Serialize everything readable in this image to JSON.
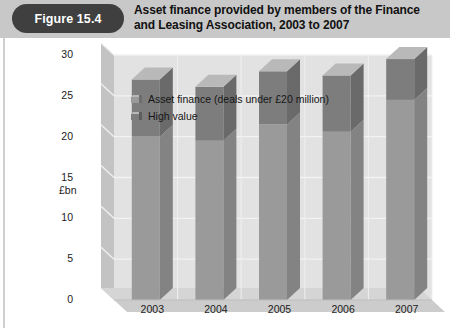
{
  "figure": {
    "number_label": "Figure 15.4",
    "title": "Asset finance provided by members of the Finance and Leasing Association, 2003 to 2007"
  },
  "colors": {
    "header_band": "#c8c8c8",
    "pill": "#3f3f3f",
    "plot_background": "#e2e2e2",
    "wall": "#c3c3c3",
    "floor": "#d5d5d5",
    "asset_finance_front": "#9a9a9a",
    "asset_finance_side": "#838383",
    "high_value_front": "#7d7d7d",
    "high_value_side": "#6a6a6a",
    "bar_top": "#b9b9b9",
    "gridline": "#f2f2f2",
    "text": "#161616"
  },
  "chart_data": {
    "type": "bar",
    "subtype": "stacked-3d-column",
    "title": "Asset finance provided by members of the Finance and Leasing Association, 2003 to 2007",
    "xlabel": "",
    "ylabel": "£bn",
    "ylim": [
      0,
      30
    ],
    "ytick_step": 5,
    "yticks": [
      0,
      5,
      10,
      15,
      20,
      25,
      30
    ],
    "ytick_labels": [
      "0",
      "5",
      "10",
      "15",
      "20",
      "25",
      "30"
    ],
    "grid": true,
    "legend_position": "top-left-inside",
    "categories": [
      "2003",
      "2004",
      "2005",
      "2006",
      "2007"
    ],
    "series": [
      {
        "name": "Asset finance (deals under £20 million)",
        "values": [
          20.0,
          19.5,
          21.5,
          20.6,
          24.5
        ]
      },
      {
        "name": "High value",
        "values": [
          7.0,
          6.6,
          6.5,
          6.9,
          5.0
        ]
      }
    ],
    "totals": [
      27.0,
      26.1,
      28.0,
      27.5,
      29.5
    ]
  }
}
